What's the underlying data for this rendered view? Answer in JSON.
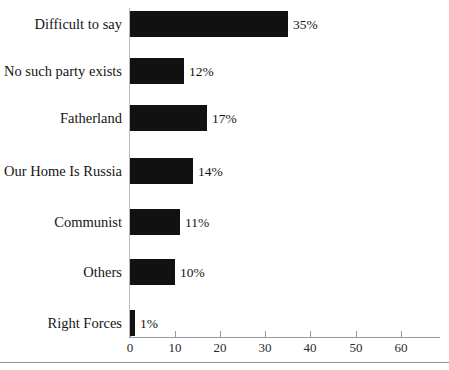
{
  "chart_data": {
    "type": "bar",
    "orientation": "horizontal",
    "title": "",
    "subtitle": "",
    "xlabel": "",
    "ylabel": "",
    "xlim": [
      0,
      68.5
    ],
    "grid": false,
    "legend": null,
    "axis_ticks": [
      0,
      10,
      20,
      30,
      40,
      50,
      60
    ],
    "tick_labels": [
      "0",
      "10",
      "20",
      "30",
      "40",
      "50",
      "60"
    ],
    "categories": [
      "Difficult to say",
      "No such party exists",
      "Fatherland",
      "Our Home Is Russia",
      "Communist",
      "Others",
      "Right Forces"
    ],
    "values": [
      35,
      12,
      17,
      14,
      11,
      10,
      1
    ],
    "data_labels": [
      "35%",
      "12%",
      "17%",
      "14%",
      "11%",
      "10%",
      "1%"
    ],
    "bar_color": "#111111",
    "axis_color": "#9a9a9a"
  }
}
